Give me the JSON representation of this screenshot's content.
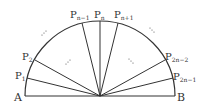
{
  "diagram": {
    "labels": {
      "A": "A",
      "B": "B",
      "P1": {
        "main": "P",
        "sub": "1"
      },
      "P2": {
        "main": "P",
        "sub": "2"
      },
      "Pn_minus_1": {
        "main": "P",
        "sub": "n−1"
      },
      "Pn": {
        "main": "P",
        "sub": "n"
      },
      "Pn_plus_1": {
        "main": "P",
        "sub": "n+1"
      },
      "P2n_minus_2": {
        "main": "P",
        "sub": "2n−2"
      },
      "P2n_minus_1": {
        "main": "P",
        "sub": "2n−1"
      }
    },
    "ellipsis": "⋰",
    "ellipsis2": "⋱",
    "colors": {
      "stroke": "#333333",
      "background": "#ffffff"
    }
  }
}
